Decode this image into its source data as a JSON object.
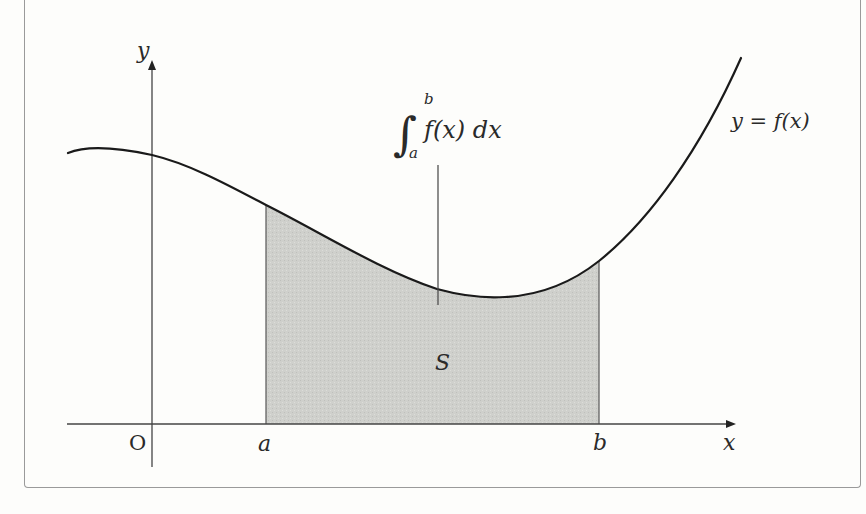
{
  "diagram": {
    "labels": {
      "y_axis": "y",
      "x_axis": "x",
      "origin": "O",
      "lower_bound": "a",
      "upper_bound": "b",
      "curve": "y = f(x)",
      "area": "S",
      "integral_upper": "b",
      "integral_lower": "a",
      "integral_body": "f(x) dx",
      "integral_sign": "∫"
    },
    "colors": {
      "curve": "#1a1a1a",
      "axes": "#444444",
      "shaded_area": "#cfd0cc",
      "frame": "#9a9a9a",
      "background": "#fdfdfb"
    },
    "elements": [
      "x-axis with arrow",
      "y-axis with arrow",
      "curve y = f(x)",
      "shaded region S between x=a and x=b under the curve",
      "integral annotation with pointer line into region"
    ]
  }
}
